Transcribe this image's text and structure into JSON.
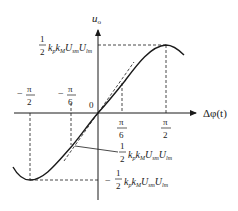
{
  "diagram": {
    "type": "phase-detector characteristic curve",
    "axes": {
      "y_label": "u",
      "y_label_sub": "o",
      "x_label": "Δφ(t)",
      "origin_label": "0"
    },
    "x_ticks": [
      {
        "num": "π",
        "den": "2",
        "sign": "−",
        "value": "-pi/2"
      },
      {
        "num": "π",
        "den": "6",
        "sign": "−",
        "value": "-pi/6"
      },
      {
        "num": "π",
        "den": "6",
        "sign": "",
        "value": "pi/6"
      },
      {
        "num": "π",
        "den": "2",
        "sign": "",
        "value": "pi/2"
      }
    ],
    "annotations": {
      "max": {
        "sign": "",
        "frac_num": "1",
        "frac_den": "2",
        "expr": "kpkMUsmUlm"
      },
      "slope": {
        "sign": "",
        "frac_num": "1",
        "frac_den": "2",
        "expr": "kpkMUsmUlm"
      },
      "min": {
        "sign": "−",
        "frac_num": "1",
        "frac_den": "2",
        "expr": "kpkMUsmUlm"
      }
    },
    "curve": "u_o = 1/2 kp kM Usm Ulm sin(Δφ)",
    "tangent": "dashed line through origin with slope 1/2 kp kM Usm Ulm"
  },
  "colors": {
    "ink": "#1a1a1a",
    "background": "#ffffff"
  }
}
